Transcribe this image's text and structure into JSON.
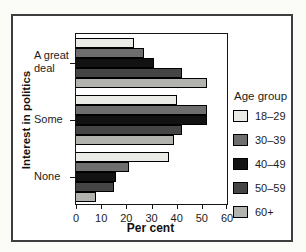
{
  "chart_data": {
    "type": "bar",
    "orientation": "horizontal",
    "xlabel": "Per cent",
    "ylabel": "Interest in politics",
    "categories": [
      "A great deal",
      "Some",
      "None"
    ],
    "xlim": [
      0,
      60
    ],
    "xticks": [
      "0",
      "10",
      "20",
      "30",
      "40",
      "50",
      "60"
    ],
    "grid": false,
    "legend": {
      "title": "Age group",
      "position": "right"
    },
    "series": [
      {
        "name": "18–29",
        "color": "#eaeae6",
        "values": [
          23,
          40,
          37
        ]
      },
      {
        "name": "30–39",
        "color": "#6e6e6e",
        "values": [
          27,
          52,
          21
        ]
      },
      {
        "name": "40–49",
        "color": "#121212",
        "values": [
          31,
          52,
          16
        ]
      },
      {
        "name": "50–59",
        "color": "#454545",
        "values": [
          42,
          42,
          15
        ]
      },
      {
        "name": "60+",
        "color": "#b2b2ae",
        "values": [
          52,
          39,
          8
        ]
      }
    ]
  }
}
